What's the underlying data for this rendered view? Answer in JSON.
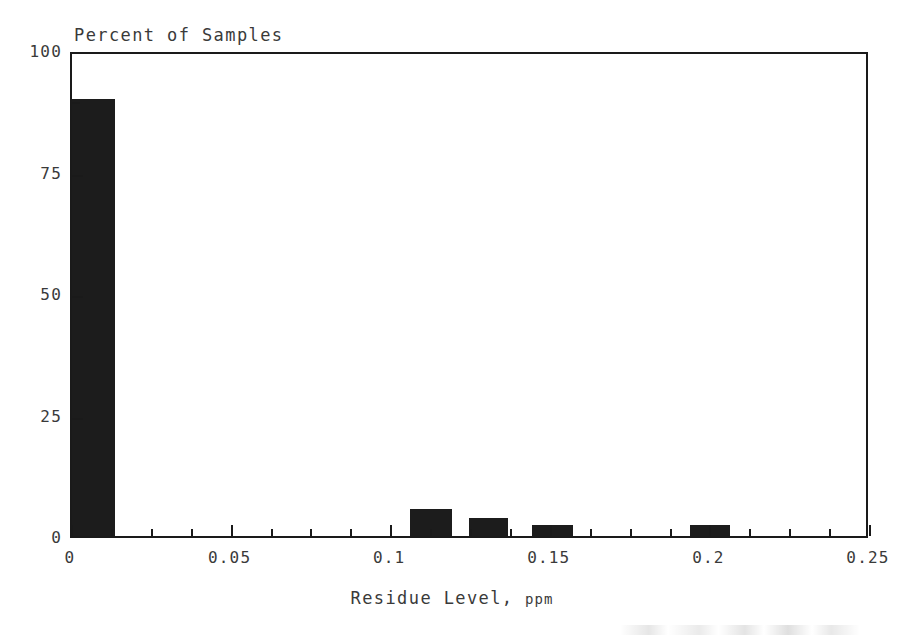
{
  "chart_data": {
    "type": "bar",
    "title": "",
    "xlabel": "Residue Level, ppm",
    "xlabel_main": "Residue Level, ",
    "xlabel_unit": "ppm",
    "ylabel": "Percent of Samples",
    "xlim": [
      0,
      0.25
    ],
    "ylim": [
      0,
      100
    ],
    "grid": false,
    "legend": false,
    "bar_color": "#1c1c1c",
    "frame_color": "#1a1a1a",
    "text_color": "#3a3a3a",
    "x_ticks": [
      {
        "value": 0,
        "label": "0"
      },
      {
        "value": 0.05,
        "label": "0.05"
      },
      {
        "value": 0.1,
        "label": "0.1"
      },
      {
        "value": 0.15,
        "label": "0.15"
      },
      {
        "value": 0.2,
        "label": "0.2"
      },
      {
        "value": 0.25,
        "label": "0.25"
      }
    ],
    "x_minor_tick_step": 0.0125,
    "y_ticks": [
      {
        "value": 0,
        "label": "0"
      },
      {
        "value": 25,
        "label": "25"
      },
      {
        "value": 50,
        "label": "50"
      },
      {
        "value": 75,
        "label": "75"
      },
      {
        "value": 100,
        "label": "100"
      }
    ],
    "y_minor_ticks": [
      90
    ],
    "bars": [
      {
        "x_start": 0.0,
        "x_end": 0.0135,
        "value": 90.0
      },
      {
        "x_start": 0.106,
        "x_end": 0.119,
        "value": 5.5
      },
      {
        "x_start": 0.1245,
        "x_end": 0.1365,
        "value": 3.7
      },
      {
        "x_start": 0.144,
        "x_end": 0.157,
        "value": 2.2
      },
      {
        "x_start": 0.1935,
        "x_end": 0.206,
        "value": 2.2
      }
    ],
    "categories": [
      "0-0.0135",
      "0.106-0.119",
      "0.1245-0.1365",
      "0.144-0.157",
      "0.1935-0.206"
    ],
    "values": [
      90.0,
      5.5,
      3.7,
      2.2,
      2.2
    ]
  }
}
